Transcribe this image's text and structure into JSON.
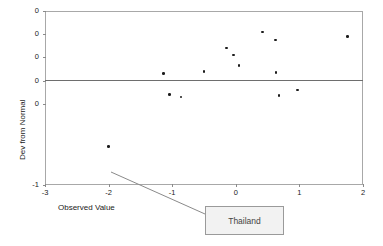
{
  "chart_data": {
    "type": "scatter",
    "title": "",
    "xlabel": "Observed Value",
    "ylabel": "Dev from Normal",
    "xlim": [
      -3,
      2
    ],
    "ylim": [
      -1,
      0.5
    ],
    "grid": false,
    "legend": null,
    "xticks": [
      "-3",
      "-2",
      "-1",
      "0",
      "1",
      "2"
    ],
    "xtick_values": [
      -3,
      -2,
      -1,
      0,
      1,
      2
    ],
    "yticks": [
      "0",
      "0",
      "0",
      "0",
      "0",
      "-1"
    ],
    "ytick_values": [
      0.5,
      0.3,
      0.1,
      -0.1,
      -0.3,
      -1.0
    ],
    "reference_line": {
      "axis": "y",
      "value": 0.0
    },
    "points": [
      {
        "x": -2.0,
        "y": -0.67,
        "label": "Thailand"
      },
      {
        "x": -1.14,
        "y": -0.04
      },
      {
        "x": -1.04,
        "y": -0.22
      },
      {
        "x": -0.86,
        "y": -0.24
      },
      {
        "x": -0.5,
        "y": -0.02
      },
      {
        "x": -0.15,
        "y": 0.18
      },
      {
        "x": -0.04,
        "y": 0.12
      },
      {
        "x": 0.05,
        "y": 0.03
      },
      {
        "x": 0.42,
        "y": 0.32
      },
      {
        "x": 0.62,
        "y": 0.25
      },
      {
        "x": 0.63,
        "y": -0.03
      },
      {
        "x": 0.68,
        "y": -0.23
      },
      {
        "x": 0.97,
        "y": -0.18
      },
      {
        "x": 1.76,
        "y": 0.28
      }
    ],
    "annotations": [
      {
        "text": "Thailand",
        "points_to": {
          "x": -2.0,
          "y": -0.67
        }
      }
    ]
  },
  "callout": {
    "label": "Thailand"
  },
  "colors": {
    "point": "#1c1c1c",
    "frame": "#a8a8a8",
    "zero_line": "#6e6e6e",
    "callout_fill": "#f2f2f2",
    "callout_border": "#9a9a9a",
    "text": "#1a1a1a"
  }
}
